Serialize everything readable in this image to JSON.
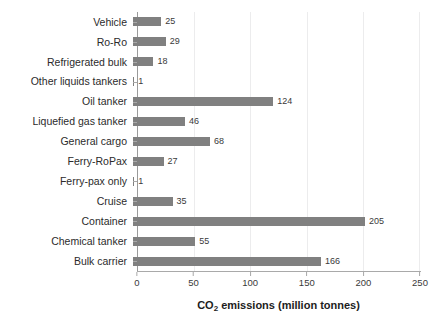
{
  "chart_data": {
    "type": "bar",
    "orientation": "horizontal",
    "title": "",
    "xlabel": "CO2 emissions (million tonnes)",
    "xlabel_rich": {
      "pre": "CO",
      "sub": "2",
      "post": " emissions (million tonnes)"
    },
    "ylabel": "",
    "xlim": [
      0,
      250
    ],
    "xticks": [
      0,
      50,
      100,
      150,
      200,
      250
    ],
    "xtick_labels": [
      "0",
      "50",
      "100",
      "150",
      "200",
      "250"
    ],
    "grid": "vertical-only",
    "legend": "none",
    "data_labels": true,
    "categories": [
      "Vehicle",
      "Ro-Ro",
      "Refrigerated bulk",
      "Other liquids tankers",
      "Oil tanker",
      "Liquefied gas tanker",
      "General cargo",
      "Ferry-RoPax",
      "Ferry-pax only",
      "Cruise",
      "Container",
      "Chemical tanker",
      "Bulk carrier"
    ],
    "values": [
      25,
      29,
      18,
      1,
      124,
      46,
      68,
      27,
      1,
      35,
      205,
      55,
      166
    ],
    "value_labels": [
      "25",
      "29",
      "18",
      "1",
      "124",
      "46",
      "68",
      "27",
      "1",
      "35",
      "205",
      "55",
      "166"
    ],
    "colors": {
      "bar": "#808080",
      "gridline": "#ececed",
      "axis": "#a9a9a9",
      "label_text": "#2b2b2b",
      "value_text": "#3a3a3a",
      "background": "#ffffff"
    }
  }
}
